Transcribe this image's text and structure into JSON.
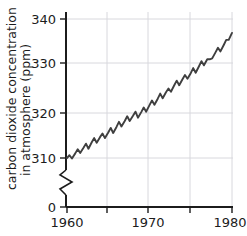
{
  "chart_data": {
    "type": "line",
    "title": "",
    "xlabel": "",
    "ylabel": "carbon dioxide concentration in atmosphere (ppm)",
    "ylabel_line1": "carbon dioxide concentration",
    "ylabel_line2": "in atmosphere (ppm)",
    "xlim": [
      1960,
      1980
    ],
    "ylim": [
      310,
      342
    ],
    "y_axis_break": true,
    "y_axis_break_note": "axis broken between 0 and 310",
    "grid": true,
    "legend": null,
    "y_ticks": [
      0,
      310,
      320,
      330,
      340
    ],
    "y_tick_labels": [
      "0",
      "310",
      "320",
      "330",
      "340"
    ],
    "x_ticks": [
      1960,
      1965,
      1970,
      1975,
      1980
    ],
    "x_tick_labels": [
      "1960",
      "",
      "1970",
      "",
      "1980"
    ],
    "x_major_tick_labels": [
      "1960",
      "1970",
      "1980"
    ],
    "line_color": "#3f3f3f",
    "grid_color": "#d8d8dd",
    "axis_color": "#1c1c1c",
    "background_color": "#ffffff",
    "series": [
      {
        "name": "carbon dioxide concentration",
        "x": [
          1960.0,
          1960.3,
          1960.6,
          1961.0,
          1961.3,
          1961.6,
          1962.0,
          1962.3,
          1962.6,
          1963.0,
          1963.3,
          1963.6,
          1964.0,
          1964.3,
          1964.6,
          1965.0,
          1965.3,
          1965.6,
          1966.0,
          1966.3,
          1966.6,
          1967.0,
          1967.3,
          1967.6,
          1968.0,
          1968.3,
          1968.6,
          1969.0,
          1969.3,
          1969.6,
          1970.0,
          1970.3,
          1970.6,
          1971.0,
          1971.3,
          1971.6,
          1972.0,
          1972.3,
          1972.6,
          1973.0,
          1973.3,
          1973.6,
          1974.0,
          1974.3,
          1974.6,
          1975.0,
          1975.3,
          1975.6,
          1976.0,
          1976.3,
          1976.6,
          1977.0,
          1977.3,
          1977.6,
          1978.0,
          1978.3,
          1978.6,
          1979.0,
          1979.3,
          1979.6,
          1980.0
        ],
        "y": [
          310.0,
          310.6,
          309.9,
          311.0,
          311.9,
          311.1,
          312.2,
          313.1,
          312.0,
          313.4,
          314.3,
          313.3,
          314.5,
          315.3,
          314.3,
          315.5,
          316.5,
          315.4,
          316.7,
          317.8,
          316.8,
          318.0,
          319.0,
          318.0,
          319.1,
          320.0,
          318.7,
          319.9,
          320.9,
          320.0,
          321.4,
          322.4,
          321.5,
          322.8,
          323.9,
          322.9,
          324.2,
          325.0,
          324.3,
          325.7,
          326.7,
          325.7,
          327.0,
          327.9,
          327.1,
          328.3,
          329.4,
          328.4,
          329.8,
          330.9,
          330.0,
          331.3,
          331.3,
          331.5,
          332.8,
          333.8,
          333.0,
          334.4,
          335.5,
          335.5,
          337.0
        ],
        "units": "ppm"
      }
    ]
  },
  "axis": {
    "y_label_line1": "carbon dioxide concentration",
    "y_label_line2": "in atmosphere (ppm)",
    "y_tick_0": "0",
    "y_tick_310": "310",
    "y_tick_320": "320",
    "y_tick_330": "330",
    "y_tick_340": "340",
    "x_tick_1960": "1960",
    "x_tick_1970": "1970",
    "x_tick_1980": "1980"
  }
}
